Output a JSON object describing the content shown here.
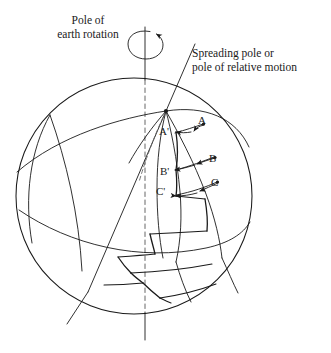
{
  "figure": {
    "domain": "Diagram",
    "kind": "schematic-diagram",
    "background_color": "#ffffff",
    "line_color": "#1a1a1a",
    "width": 331,
    "height": 353
  },
  "labels": {
    "rotation_pole": {
      "line1": "Pole of",
      "line2": "earth rotation"
    },
    "spreading_pole": {
      "line1": "Spreading pole or",
      "line2": "pole of relative motion"
    }
  },
  "points": {
    "A": "A",
    "A_prime": "A'",
    "B": "B",
    "B_prime": "B'",
    "C": "C",
    "C_prime": "C'"
  },
  "geometry": {
    "sphere": {
      "cx": 134,
      "cy": 196,
      "r": 118
    },
    "rotation_axis": {
      "x": 145,
      "top_y": 27,
      "bottom_y": 340,
      "dashed_inside": true
    },
    "spreading_axis": {
      "x1": 195,
      "y1": 44,
      "x2": 67,
      "y2": 324
    },
    "spreading_pole_node": {
      "x": 166,
      "y": 111
    },
    "rotation_arrow": {
      "cx": 145,
      "cy": 44,
      "rx": 16,
      "ry": 14,
      "direction": "counterclockwise-viewed-from-top"
    }
  }
}
